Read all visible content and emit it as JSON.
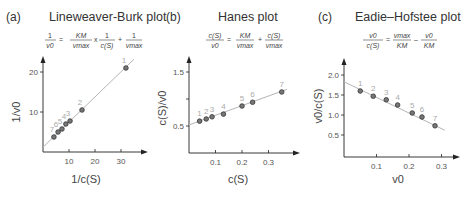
{
  "chart_data": [
    {
      "type": "scatter",
      "panel": "(a)",
      "title": "Lineweaver-Burk plot",
      "equation": {
        "lhs_num": "1",
        "lhs_den": "v0",
        "t1_num": "KM",
        "t1_den": "vmax",
        "op1": "x",
        "t2_num": "1",
        "t2_den": "c(S)",
        "op2": "+",
        "t3_num": "1",
        "t3_den": "vmax"
      },
      "xlabel": "1/c(S)",
      "ylabel": "1/v0",
      "xlim": [
        0,
        38
      ],
      "ylim": [
        0,
        24
      ],
      "xticks": [
        10,
        20,
        30
      ],
      "yticks": [
        10,
        20
      ],
      "points": [
        {
          "label": "1",
          "x": 31.9,
          "y": 21.0
        },
        {
          "label": "2",
          "x": 15.0,
          "y": 10.5
        },
        {
          "label": "3",
          "x": 10.4,
          "y": 7.75
        },
        {
          "label": "4",
          "x": 8.8,
          "y": 7.0
        },
        {
          "label": "5",
          "x": 7.3,
          "y": 5.75
        },
        {
          "label": "6",
          "x": 5.8,
          "y": 5.0
        },
        {
          "label": "7",
          "x": 4.2,
          "y": 3.75
        }
      ],
      "fit_line": {
        "x0": 0,
        "y0": 1.2,
        "x1": 35,
        "y1": 23.2
      }
    },
    {
      "type": "scatter",
      "panel": "(b)",
      "title": "Hanes plot",
      "equation": {
        "lhs_num": "c(S)",
        "lhs_den": "v0",
        "t1_num": "KM",
        "t1_den": "vmax",
        "op1": "+",
        "t2_num": "c(S)",
        "t2_den": "vmax"
      },
      "xlabel": "c(S)",
      "ylabel": "c(S)/v0",
      "xlim": [
        0,
        0.4
      ],
      "ylim": [
        0,
        1.6
      ],
      "xticks": [
        0.1,
        0.2,
        0.3
      ],
      "yticks": [
        0.5,
        1.0,
        1.5
      ],
      "ytick_labels": [
        "0.5",
        "",
        "1.5"
      ],
      "points": [
        {
          "label": "1",
          "x": 0.04,
          "y": 0.59
        },
        {
          "label": "2",
          "x": 0.065,
          "y": 0.63
        },
        {
          "label": "3",
          "x": 0.087,
          "y": 0.67
        },
        {
          "label": "4",
          "x": 0.13,
          "y": 0.72
        },
        {
          "label": "5",
          "x": 0.2,
          "y": 0.87
        },
        {
          "label": "6",
          "x": 0.24,
          "y": 0.94
        },
        {
          "label": "7",
          "x": 0.35,
          "y": 1.13
        }
      ],
      "fit_line": {
        "x0": 0,
        "y0": 0.52,
        "x1": 0.37,
        "y1": 1.18
      }
    },
    {
      "type": "scatter",
      "panel": "(c)",
      "title": "Eadie–Hofstee plot",
      "equation": {
        "lhs_num": "v0",
        "lhs_den": "c(S)",
        "t1_num": "vmax",
        "t1_den": "KM",
        "op1": "–",
        "t2_num": "v0",
        "t2_den": "KM"
      },
      "xlabel": "v0",
      "ylabel": "v0/c(S)",
      "xlim": [
        0,
        0.33
      ],
      "ylim": [
        0,
        2.2
      ],
      "xticks": [
        0.1,
        0.2,
        0.3
      ],
      "yticks": [
        0.5,
        1.0,
        1.5,
        2.0
      ],
      "ytick_labels": [
        "0.5",
        "1.0",
        "1.5",
        "2.0"
      ],
      "points": [
        {
          "label": "1",
          "x": 0.05,
          "y": 1.6
        },
        {
          "label": "2",
          "x": 0.09,
          "y": 1.47
        },
        {
          "label": "3",
          "x": 0.13,
          "y": 1.38
        },
        {
          "label": "4",
          "x": 0.165,
          "y": 1.25
        },
        {
          "label": "5",
          "x": 0.21,
          "y": 1.05
        },
        {
          "label": "6",
          "x": 0.24,
          "y": 0.95
        },
        {
          "label": "7",
          "x": 0.28,
          "y": 0.73
        }
      ],
      "fit_line": {
        "x0": 0,
        "y0": 1.83,
        "x1": 0.31,
        "y1": 0.62
      }
    }
  ]
}
